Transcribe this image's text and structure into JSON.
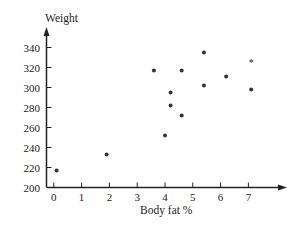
{
  "chart_data": {
    "type": "scatter",
    "title": "",
    "xlabel": "Body fat %",
    "ylabel": "Weight",
    "xlim": [
      0,
      8
    ],
    "ylim": [
      200,
      350
    ],
    "x_ticks": [
      0,
      1,
      2,
      3,
      4,
      5,
      6,
      7
    ],
    "y_ticks": [
      200,
      220,
      240,
      260,
      280,
      300,
      320,
      340
    ],
    "grid": false,
    "legend": null,
    "series": [
      {
        "name": "points",
        "marker": "dot",
        "points": [
          {
            "x": 0.1,
            "y": 217
          },
          {
            "x": 1.9,
            "y": 233
          },
          {
            "x": 3.6,
            "y": 317
          },
          {
            "x": 4.0,
            "y": 252
          },
          {
            "x": 4.2,
            "y": 295
          },
          {
            "x": 4.2,
            "y": 282
          },
          {
            "x": 4.6,
            "y": 317
          },
          {
            "x": 4.6,
            "y": 272
          },
          {
            "x": 5.4,
            "y": 335
          },
          {
            "x": 5.4,
            "y": 302
          },
          {
            "x": 6.2,
            "y": 311
          },
          {
            "x": 7.1,
            "y": 298
          }
        ]
      },
      {
        "name": "marked point",
        "marker": "asterisk",
        "points": [
          {
            "x": 7.1,
            "y": 327
          }
        ]
      }
    ]
  },
  "labels": {
    "y_axis_title": "Weight",
    "x_axis_title": "Body fat %",
    "x_tick_labels": [
      "0",
      "1",
      "2",
      "3",
      "4",
      "5",
      "6",
      "7"
    ],
    "y_tick_labels": [
      "200",
      "220",
      "240",
      "260",
      "280",
      "300",
      "320",
      "340"
    ]
  },
  "colors": {
    "axis": "#222222",
    "point": "#333333",
    "background": "#ffffff"
  }
}
